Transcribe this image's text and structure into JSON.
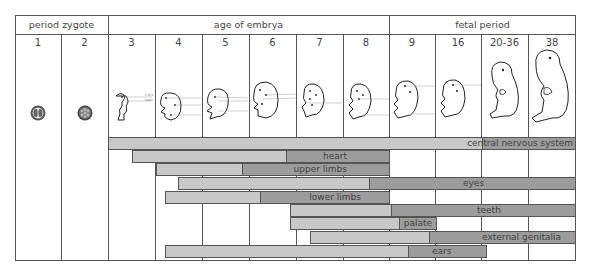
{
  "header": {
    "period_zygote": "period zygote",
    "age_of_embrya": "age of embrya",
    "fetal_period": "fetal period"
  },
  "weeks": [
    "1",
    "2",
    "3",
    "4",
    "5",
    "6",
    "7",
    "8",
    "9",
    "16",
    "20-36",
    "38"
  ],
  "embryo_labels": {
    "w3": [
      "C.N.S.",
      "heart"
    ],
    "w4": [
      "eyes",
      "heart",
      "limbs"
    ],
    "w5": [
      "eyes",
      "heart",
      "limbs"
    ],
    "w6": [
      "ears",
      "teeth"
    ],
    "w7": [
      "palate"
    ],
    "w8": [
      "palate",
      "external genitalia"
    ],
    "w9": [
      "brain",
      "external genitalia"
    ],
    "w16": [
      "brain"
    ]
  },
  "icons": {
    "zygote_week1": "two-cell-zygote-icon",
    "zygote_week2": "morula-icon"
  },
  "colors": {
    "light_bar": "#c8c8c8",
    "dark_bar": "#9c9c9c",
    "grid": "#555555"
  },
  "bars": [
    {
      "label": "central nervous system",
      "start_x": 108,
      "dark_x": 481,
      "end_x": 575
    },
    {
      "label": "heart",
      "start_x": 132,
      "dark_x": 285,
      "end_x": 389
    },
    {
      "label": "upper limbs",
      "start_x": 156,
      "dark_x": 241,
      "end_x": 389
    },
    {
      "label": "eyes",
      "start_x": 178,
      "dark_x": 368,
      "end_x": 575
    },
    {
      "label": "lower limbs",
      "start_x": 165,
      "dark_x": 259,
      "end_x": 389
    },
    {
      "label": "teeth",
      "start_x": 290,
      "dark_x": 390,
      "end_x": 575
    },
    {
      "label": "palate",
      "start_x": 290,
      "dark_x": 398,
      "end_x": 437
    },
    {
      "label": "external genitalia",
      "start_x": 310,
      "dark_x": 428,
      "end_x": 575
    },
    {
      "label": "ears",
      "start_x": 165,
      "dark_x": 407,
      "end_x": 487
    }
  ]
}
